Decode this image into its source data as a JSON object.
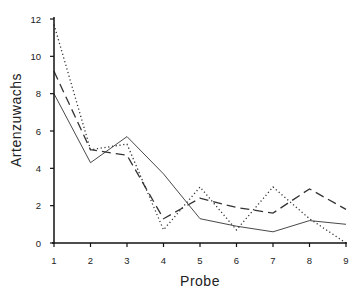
{
  "chart_data": {
    "type": "line",
    "title": "",
    "xlabel": "Probe",
    "ylabel": "Artenzuwachs",
    "x": [
      1,
      2,
      3,
      4,
      5,
      6,
      7,
      8,
      9
    ],
    "x_ticks": [
      "1",
      "2",
      "3",
      "4",
      "5",
      "6",
      "7",
      "8",
      "9"
    ],
    "y_ticks": [
      "0",
      "2",
      "4",
      "6",
      "8",
      "10",
      "12"
    ],
    "xlim": [
      1,
      9
    ],
    "ylim": [
      0,
      12
    ],
    "grid": false,
    "legend": null,
    "series": [
      {
        "name": "solid",
        "style": "solid",
        "values": [
          8.0,
          4.3,
          5.7,
          3.7,
          1.3,
          0.9,
          0.6,
          1.2,
          1.0
        ]
      },
      {
        "name": "dashed",
        "style": "dashed",
        "values": [
          9.2,
          5.0,
          4.7,
          1.3,
          2.4,
          1.9,
          1.6,
          2.9,
          1.8
        ]
      },
      {
        "name": "dotted",
        "style": "dotted",
        "values": [
          11.7,
          5.0,
          5.3,
          0.7,
          3.0,
          0.7,
          3.0,
          1.3,
          0.0
        ]
      }
    ]
  },
  "colors": {
    "line": "#333333",
    "axis": "#111111"
  }
}
